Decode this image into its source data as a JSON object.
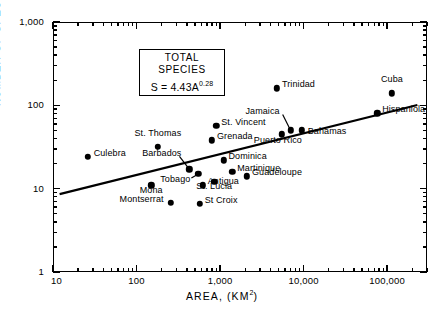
{
  "chart_data": {
    "type": "scatter",
    "title": "",
    "xlabel": "AREA, (KM2)",
    "ylabel": "NUMBER OF SPECIES",
    "xscale": "log",
    "yscale": "log",
    "xlim": [
      10,
      300000
    ],
    "ylim": [
      1,
      1000
    ],
    "grid": false,
    "legend": false,
    "xtick_labels": [
      "10",
      "100",
      "1,000",
      "10,000",
      "100,000"
    ],
    "xtick_values": [
      10,
      100,
      1000,
      10000,
      100000
    ],
    "ytick_labels": [
      "1,000",
      "100",
      "10",
      "1"
    ],
    "ytick_values": [
      1000,
      100,
      10,
      1
    ],
    "annotation_box": {
      "line1": "TOTAL",
      "line2": "SPECIES",
      "equation_lead": "S = 4.43A",
      "equation_exp": "0.28",
      "coefficient": 4.43,
      "exponent": 0.28
    },
    "fit_line": {
      "label": "S = 4.43A^0.28",
      "x_start": 12,
      "y_start": 8.6,
      "x_end": 230000,
      "y_end": 101
    },
    "points": [
      {
        "name": "Culebra",
        "area": 26,
        "species": 24,
        "label_side": "right"
      },
      {
        "name": "St. Thomas",
        "area": 180,
        "species": 32,
        "label_side": "above"
      },
      {
        "name": "Mona",
        "area": 150,
        "species": 11,
        "label_side": "below"
      },
      {
        "name": "Montserrat",
        "area": 256,
        "species": 6.8,
        "label_side": "left"
      },
      {
        "name": "Barbados",
        "area": 430,
        "species": 17,
        "label_side": "above-leader"
      },
      {
        "name": "Tobago",
        "area": 550,
        "species": 15,
        "label_side": "below-leader"
      },
      {
        "name": "Antigua",
        "area": 620,
        "species": 11,
        "label_side": "right"
      },
      {
        "name": "St Croix",
        "area": 570,
        "species": 6.6,
        "label_side": "right"
      },
      {
        "name": "St. Lucia",
        "area": 850,
        "species": 12,
        "label_side": "below"
      },
      {
        "name": "Grenada",
        "area": 800,
        "species": 38,
        "label_side": "right"
      },
      {
        "name": "St. Vincent",
        "area": 900,
        "species": 57,
        "label_side": "right"
      },
      {
        "name": "Dominica",
        "area": 1100,
        "species": 22,
        "label_side": "right"
      },
      {
        "name": "Martinique",
        "area": 1400,
        "species": 16,
        "label_side": "right"
      },
      {
        "name": "Guadeloupe",
        "area": 2100,
        "species": 14,
        "label_side": "right"
      },
      {
        "name": "Puerto Rico",
        "area": 5500,
        "species": 45,
        "label_side": "below"
      },
      {
        "name": "Jamaica",
        "area": 7000,
        "species": 50,
        "label_side": "above-leader"
      },
      {
        "name": "Bahamas",
        "area": 9500,
        "species": 50,
        "label_side": "right"
      },
      {
        "name": "Trinidad",
        "area": 4800,
        "species": 160,
        "label_side": "right"
      },
      {
        "name": "Hispaniola",
        "area": 76000,
        "species": 80,
        "label_side": "right"
      },
      {
        "name": "Cuba",
        "area": 114000,
        "species": 140,
        "label_side": "above"
      }
    ]
  }
}
